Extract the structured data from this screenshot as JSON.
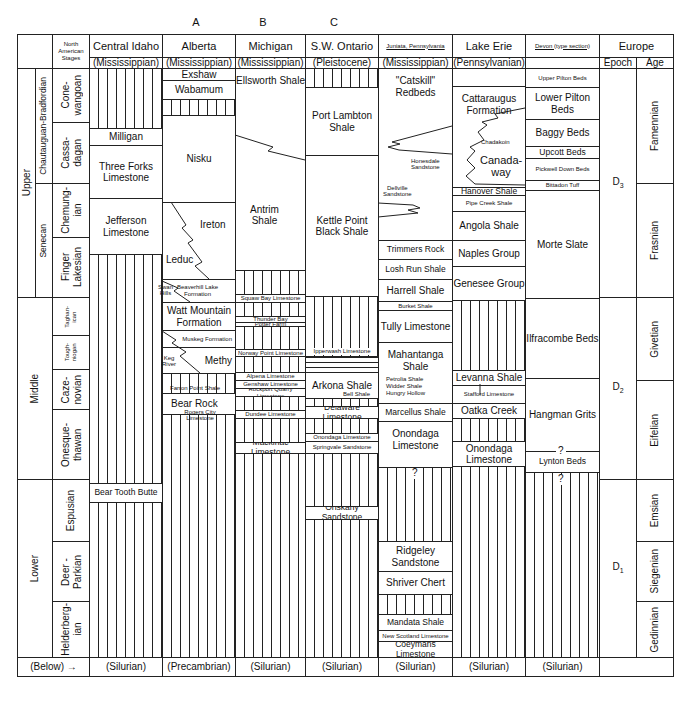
{
  "column_letters": [
    {
      "label": "A",
      "x": 196
    },
    {
      "label": "B",
      "x": 263
    },
    {
      "label": "C",
      "x": 334
    }
  ],
  "header": {
    "stages_label": "North American Stages",
    "columns": [
      {
        "id": "central-idaho",
        "name": "Central Idaho",
        "below": "(Mississippian)"
      },
      {
        "id": "alberta",
        "name": "Alberta",
        "below": "(Mississippian)"
      },
      {
        "id": "michigan",
        "name": "Michigan",
        "below": "(Mississippian)"
      },
      {
        "id": "sw-ontario",
        "name": "S.W. Ontario",
        "below": "(Pleistocene)"
      },
      {
        "id": "juniata",
        "name": "Juniata, Pennsylvania",
        "below": "(Mississippian)"
      },
      {
        "id": "lake-erie",
        "name": "Lake Erie",
        "below": "(Pennsylvanian)"
      },
      {
        "id": "devon",
        "name": "Devon (type section)",
        "below": ""
      }
    ],
    "europe": {
      "name": "Europe",
      "epoch": "Epoch",
      "age": "Age"
    }
  },
  "series": [
    {
      "label": "Upper",
      "y0": 68,
      "y1": 297
    },
    {
      "label": "Middle",
      "y0": 297,
      "y1": 479
    },
    {
      "label": "Lower",
      "y0": 479,
      "y1": 657
    }
  ],
  "subseries": [
    {
      "label": "Chautauguan-Bradfordian",
      "y0": 68,
      "y1": 183
    },
    {
      "label": "Senecan",
      "y0": 183,
      "y1": 297
    }
  ],
  "stages": [
    {
      "label": "Cone-\nwangoan",
      "y0": 68,
      "y1": 122
    },
    {
      "label": "Cassa-\ndagan",
      "y0": 122,
      "y1": 183
    },
    {
      "label": "Chemung-\nian",
      "y0": 183,
      "y1": 237
    },
    {
      "label": "Finger\nLakesian",
      "y0": 237,
      "y1": 297
    },
    {
      "label": "Taghan-\nican",
      "y0": 297,
      "y1": 335
    },
    {
      "label": "Tough-\nniogan",
      "y0": 335,
      "y1": 369
    },
    {
      "label": "Caze-\nnovian",
      "y0": 369,
      "y1": 409
    },
    {
      "label": "Onesque-\nthawan",
      "y0": 409,
      "y1": 479
    },
    {
      "label": "Espusian",
      "y0": 479,
      "y1": 541
    },
    {
      "label": "Deer -\nParkian",
      "y0": 541,
      "y1": 601
    },
    {
      "label": "Helderberg-\nian",
      "y0": 601,
      "y1": 657
    }
  ],
  "units": {
    "central_idaho": [
      {
        "label": "",
        "y0": 68,
        "y1": 128,
        "hatch": true
      },
      {
        "label": "Milligan",
        "y0": 128,
        "y1": 145,
        "size": "t"
      },
      {
        "label": "Three Forks Limestone",
        "y0": 145,
        "y1": 198,
        "size": "t"
      },
      {
        "label": "Jefferson Limestone",
        "y0": 198,
        "y1": 254,
        "size": "t"
      },
      {
        "label": "",
        "y0": 254,
        "y1": 483,
        "hatch": true
      },
      {
        "label": "Bear Tooth Butte",
        "y0": 483,
        "y1": 502,
        "size": "ts"
      },
      {
        "label": "",
        "y0": 502,
        "y1": 657,
        "hatch": true
      }
    ],
    "alberta": [
      {
        "label": "Exshaw",
        "y0": 68,
        "y1": 80,
        "size": "t"
      },
      {
        "label": "Wabamum",
        "y0": 80,
        "y1": 99,
        "size": "t"
      },
      {
        "label": "",
        "y0": 99,
        "y1": 115,
        "hatch": true
      },
      {
        "label": "Nisku",
        "y0": 115,
        "y1": 202,
        "size": "t"
      },
      {
        "label": "Ireton",
        "y0": 202,
        "y1": 279,
        "size": "t",
        "align": "right-top"
      },
      {
        "label": "Beaverhill Lake Formation",
        "y0": 279,
        "y1": 302,
        "size": "tx",
        "align": "right"
      },
      {
        "label": "Watt Mountain Formation",
        "y0": 302,
        "y1": 330,
        "size": "t"
      },
      {
        "label": "Muskeg Formation",
        "y0": 330,
        "y1": 347,
        "size": "tx",
        "align": "right"
      },
      {
        "label": "Methy",
        "y0": 347,
        "y1": 373,
        "size": "t",
        "align": "right"
      },
      {
        "label": "",
        "y0": 373,
        "y1": 393,
        "hatch": true
      },
      {
        "label": "Bear Rock",
        "y0": 393,
        "y1": 414,
        "size": "t",
        "align": "left"
      },
      {
        "label": "",
        "y0": 414,
        "y1": 657,
        "hatch": true
      }
    ],
    "michigan": [
      {
        "label": "Ellsworth Shale",
        "y0": 68,
        "y1": 270,
        "size": "t",
        "align": "top"
      },
      {
        "label": "",
        "y0": 270,
        "y1": 294,
        "hatch": true
      },
      {
        "label": "Squaw Bay Limestone",
        "y0": 294,
        "y1": 302,
        "size": "tx"
      },
      {
        "label": "",
        "y0": 302,
        "y1": 316,
        "hatch": true
      },
      {
        "label": "Thunder Bay",
        "y0": 316,
        "y1": 322,
        "size": "tx"
      },
      {
        "label": "Potter Farm",
        "y0": 322,
        "y1": 326,
        "size": "tx"
      },
      {
        "label": "",
        "y0": 326,
        "y1": 349,
        "hatch": true
      },
      {
        "label": "Norway Point Limestone",
        "y0": 349,
        "y1": 356,
        "size": "tx"
      },
      {
        "label": "",
        "y0": 356,
        "y1": 372,
        "hatch": true
      },
      {
        "label": "Alpena Limestone",
        "y0": 372,
        "y1": 380,
        "size": "tx"
      },
      {
        "label": "Genshaw Limestone",
        "y0": 380,
        "y1": 388,
        "size": "tx"
      },
      {
        "label": "Rockport Quarry Limestone",
        "y0": 388,
        "y1": 396,
        "size": "tx"
      },
      {
        "label": "",
        "y0": 396,
        "y1": 410,
        "hatch": true
      },
      {
        "label": "Dundee Limestone",
        "y0": 410,
        "y1": 418,
        "size": "tx"
      },
      {
        "label": "",
        "y0": 418,
        "y1": 442,
        "hatch": true
      },
      {
        "label": "Mackinac Limestone",
        "y0": 442,
        "y1": 453,
        "size": "ts"
      },
      {
        "label": "",
        "y0": 453,
        "y1": 657,
        "hatch": true
      }
    ],
    "sw_ontario": [
      {
        "label": "",
        "y0": 68,
        "y1": 87,
        "hatch": true
      },
      {
        "label": "Port Lambton Shale",
        "y0": 87,
        "y1": 155,
        "size": "t"
      },
      {
        "label": "Kettle Point Black Shale",
        "y0": 155,
        "y1": 296,
        "size": "t"
      },
      {
        "label": "Ipperwash Limestone",
        "y0": 296,
        "y1": 356,
        "hatch": true,
        "size": "tx",
        "align": "bottom"
      },
      {
        "label": "",
        "y0": 356,
        "y1": 372,
        "lines": true
      },
      {
        "label": "Arkona Shale",
        "y0": 372,
        "y1": 398,
        "size": "t"
      },
      {
        "label": "",
        "y0": 398,
        "y1": 406,
        "hatch": true
      },
      {
        "label": "Delaware Limestone",
        "y0": 406,
        "y1": 418,
        "size": "ts"
      },
      {
        "label": "",
        "y0": 418,
        "y1": 433,
        "hatch": true
      },
      {
        "label": "Onondaga Limestone",
        "y0": 433,
        "y1": 441,
        "size": "tx"
      },
      {
        "label": "Springvale Sandstone",
        "y0": 441,
        "y1": 453,
        "size": "tx"
      },
      {
        "label": "",
        "y0": 453,
        "y1": 506,
        "hatch": true
      },
      {
        "label": "Oriskany Sandstone",
        "y0": 506,
        "y1": 519,
        "size": "ts"
      },
      {
        "label": "",
        "y0": 519,
        "y1": 657,
        "hatch": true
      }
    ],
    "juniata": [
      {
        "label": "\"Catskill\" Redbeds",
        "y0": 68,
        "y1": 240,
        "size": "t",
        "align": "top"
      },
      {
        "label": "Trimmers Rock",
        "y0": 240,
        "y1": 259,
        "size": "ts"
      },
      {
        "label": "Losh Run Shale",
        "y0": 259,
        "y1": 279,
        "size": "ts"
      },
      {
        "label": "Harrell Shale",
        "y0": 279,
        "y1": 301,
        "size": "t"
      },
      {
        "label": "Burket Shale",
        "y0": 301,
        "y1": 310,
        "size": "tx"
      },
      {
        "label": "Tully Limestone",
        "y0": 310,
        "y1": 342,
        "size": "t"
      },
      {
        "label": "Mahantanga Shale",
        "y0": 342,
        "y1": 403,
        "size": "t",
        "align": "top"
      },
      {
        "label": "Marcellus Shale",
        "y0": 403,
        "y1": 421,
        "size": "ts"
      },
      {
        "label": "Onondaga Limestone",
        "y0": 421,
        "y1": 467,
        "size": "t",
        "align": "top"
      },
      {
        "label": "",
        "y0": 467,
        "y1": 541,
        "hatch": true
      },
      {
        "label": "Ridgeley Sandstone",
        "y0": 541,
        "y1": 571,
        "size": "t"
      },
      {
        "label": "Shriver Chert",
        "y0": 571,
        "y1": 594,
        "size": "t"
      },
      {
        "label": "",
        "y0": 594,
        "y1": 614,
        "hatch": true
      },
      {
        "label": "Mandata Shale",
        "y0": 614,
        "y1": 630,
        "size": "ts"
      },
      {
        "label": "New Scotland Limestone",
        "y0": 630,
        "y1": 641,
        "size": "tx"
      },
      {
        "label": "Coeymans Limestone",
        "y0": 641,
        "y1": 657,
        "size": "ts"
      }
    ],
    "lake_erie": [
      {
        "label": "",
        "y0": 68,
        "y1": 86
      },
      {
        "label": "Cattaraugus Formation",
        "y0": 86,
        "y1": 187,
        "size": "t",
        "align": "top"
      },
      {
        "label": "Hanover Shale",
        "y0": 187,
        "y1": 195,
        "size": "ts"
      },
      {
        "label": "Pipe Creek Shale",
        "y0": 195,
        "y1": 211,
        "size": "tx"
      },
      {
        "label": "Angola Shale",
        "y0": 211,
        "y1": 240,
        "size": "t"
      },
      {
        "label": "Naples Group",
        "y0": 240,
        "y1": 266,
        "size": "t"
      },
      {
        "label": "Genesee Group",
        "y0": 266,
        "y1": 300,
        "size": "t"
      },
      {
        "label": "",
        "y0": 300,
        "y1": 370,
        "hatch": true
      },
      {
        "label": "Levanna Shale",
        "y0": 370,
        "y1": 385,
        "size": "t"
      },
      {
        "label": "Stafford Limestone",
        "y0": 385,
        "y1": 403,
        "size": "tx"
      },
      {
        "label": "Oatka Creek",
        "y0": 403,
        "y1": 418,
        "size": "t"
      },
      {
        "label": "",
        "y0": 418,
        "y1": 441,
        "hatch": true
      },
      {
        "label": "Onondaga Limestone",
        "y0": 441,
        "y1": 466,
        "size": "t"
      },
      {
        "label": "",
        "y0": 466,
        "y1": 657,
        "hatch": true
      }
    ],
    "devon": [
      {
        "label": "Upper Pilton Beds",
        "y0": 68,
        "y1": 87,
        "size": "tx"
      },
      {
        "label": "Lower Pilton Beds",
        "y0": 87,
        "y1": 119,
        "size": "t"
      },
      {
        "label": "Baggy Beds",
        "y0": 119,
        "y1": 146,
        "size": "t"
      },
      {
        "label": "Upcott Beds",
        "y0": 146,
        "y1": 158,
        "size": "ts"
      },
      {
        "label": "Pickwell Down Beds",
        "y0": 158,
        "y1": 180,
        "size": "tx"
      },
      {
        "label": "Bittadon Tuff",
        "y0": 180,
        "y1": 190,
        "size": "tx"
      },
      {
        "label": "Morte Slate",
        "y0": 190,
        "y1": 298,
        "size": "t"
      },
      {
        "label": "Ilfracombe Beds",
        "y0": 298,
        "y1": 378,
        "size": "t"
      },
      {
        "label": "Hangman Grits",
        "y0": 378,
        "y1": 451,
        "size": "t"
      },
      {
        "label": "Lynton Beds",
        "y0": 451,
        "y1": 472,
        "size": "ts"
      },
      {
        "label": "",
        "y0": 472,
        "y1": 657,
        "hatch": true
      }
    ]
  },
  "annotations": [
    {
      "text": "Ireton",
      "x": 200,
      "y": 220,
      "size": "t"
    },
    {
      "text": "Leduc",
      "x": 166,
      "y": 255,
      "size": "t"
    },
    {
      "text": "Swan Hills",
      "x": 158,
      "y": 284,
      "size": "tx"
    },
    {
      "text": "Keg River",
      "x": 162,
      "y": 355,
      "size": "tx"
    },
    {
      "text": "Antrim Shale",
      "x": 250,
      "y": 205,
      "size": "t"
    },
    {
      "text": "Honesdale Sandstone",
      "x": 411,
      "y": 158,
      "size": "tx"
    },
    {
      "text": "Dellville Sandstone",
      "x": 383,
      "y": 185,
      "size": "tx"
    },
    {
      "text": "Chadakoin",
      "x": 481,
      "y": 139,
      "size": "tx"
    },
    {
      "text": "Canada-way",
      "x": 480,
      "y": 155,
      "size": "t"
    },
    {
      "text": "Petrolia Shale",
      "x": 386,
      "y": 376,
      "size": "tx"
    },
    {
      "text": "Widder Shale",
      "x": 386,
      "y": 383,
      "size": "tx"
    },
    {
      "text": "Hungry Hollow",
      "x": 386,
      "y": 390,
      "size": "tx"
    },
    {
      "text": "Bell Shale",
      "x": 343,
      "y": 391,
      "size": "tx"
    },
    {
      "text": "Farron Point Shale",
      "x": 170,
      "y": 385,
      "size": "tx"
    },
    {
      "text": "Rogers City Limestone",
      "x": 170,
      "y": 409,
      "size": "tx"
    },
    {
      "text": "?",
      "x": 410,
      "y": 468,
      "size": "t"
    },
    {
      "text": "?",
      "x": 556,
      "y": 446,
      "size": "t"
    },
    {
      "text": "?",
      "x": 556,
      "y": 474,
      "size": "t"
    }
  ],
  "europe": {
    "epochs": [
      {
        "label": "D3",
        "base": "D",
        "sub": "3",
        "y0": 68,
        "y1": 297
      },
      {
        "label": "D2",
        "base": "D",
        "sub": "2",
        "y0": 297,
        "y1": 479
      },
      {
        "label": "D1",
        "base": "D",
        "sub": "1",
        "y0": 479,
        "y1": 657
      }
    ],
    "ages": [
      {
        "label": "Famennian",
        "y0": 68,
        "y1": 183
      },
      {
        "label": "Frasnian",
        "y0": 183,
        "y1": 297
      },
      {
        "label": "Givetian",
        "y0": 297,
        "y1": 380
      },
      {
        "label": "Eifelian",
        "y0": 380,
        "y1": 479
      },
      {
        "label": "Emsian",
        "y0": 479,
        "y1": 541
      },
      {
        "label": "Siegenian",
        "y0": 541,
        "y1": 601
      },
      {
        "label": "Gedinnian",
        "y0": 601,
        "y1": 657
      }
    ]
  },
  "footer": {
    "below_label": "(Below)",
    "arrow": "→",
    "values": [
      "(Silurian)",
      "(Precambrian)",
      "(Silurian)",
      "(Silurian)",
      "(Silurian)",
      "(Silurian)",
      "(Silurian)",
      ""
    ]
  }
}
